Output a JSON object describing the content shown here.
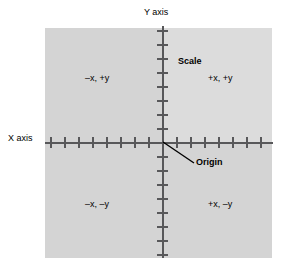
{
  "diagram": {
    "axes": {
      "y_axis_label": "Y axis",
      "x_axis_label": "X axis"
    },
    "annotations": {
      "scale_label": "Scale",
      "origin_label": "Origin"
    },
    "quadrants": {
      "quadrant_2": "–x, +y",
      "quadrant_1": "+x, +y",
      "quadrant_3": "–x, –y",
      "quadrant_4": "+x, –y"
    }
  },
  "chart_data": {
    "type": "scatter",
    "xlabel": "X axis",
    "ylabel": "Y axis",
    "grid": false,
    "legend": "none",
    "xlim": [
      -8,
      8
    ],
    "ylim": [
      -8,
      8
    ],
    "x_tick_count": 16,
    "y_tick_count": 16,
    "x_tick_spacing": 14,
    "y_tick_spacing": 14,
    "origin": [
      0,
      0
    ],
    "series": [],
    "annotations": [
      {
        "text": "Scale",
        "x": 1.2,
        "y": 6.2,
        "bold": true
      },
      {
        "text": "Origin",
        "x": 2.4,
        "y": -1.4,
        "bold": true,
        "leader_to": [
          0,
          0
        ]
      },
      {
        "text": "–x, +y",
        "x": -5.5,
        "y": 5.0
      },
      {
        "text": "+x, +y",
        "x": 3.5,
        "y": 5.0
      },
      {
        "text": "–x, –y",
        "x": -5.5,
        "y": -4.0
      },
      {
        "text": "+x, –y",
        "x": 3.5,
        "y": -4.0
      }
    ]
  },
  "colors": {
    "panel_background": "#d4d4d4",
    "panel_quadrant1_background": "#dcdcdc",
    "axis_stroke": "#58585a",
    "text": "#000000",
    "page_background": "#ffffff"
  }
}
